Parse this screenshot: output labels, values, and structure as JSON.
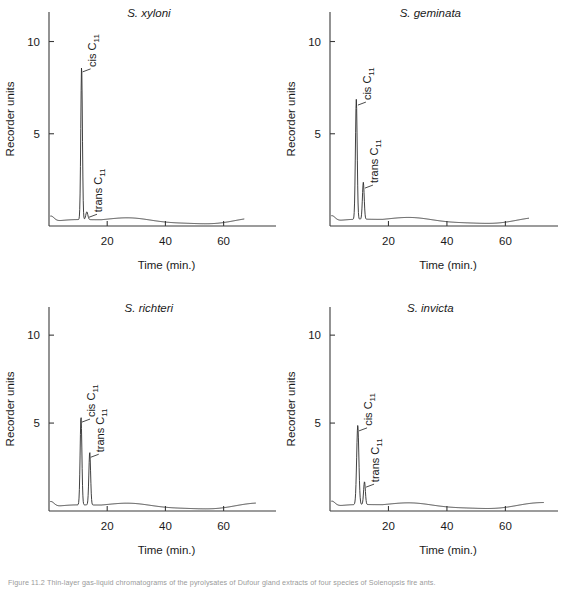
{
  "figure": {
    "caption": "Figure 11.2  Thin-layer gas-liquid chromatograms of the pyrolysates of Dufour gland extracts of four species of Solenopsis fire ants.",
    "background_color": "#ffffff",
    "trace_color": "#2b2b2b",
    "axis_color": "#3a3a3a"
  },
  "chart_data": [
    {
      "type": "line",
      "title": "S. xyloni",
      "xlabel": "Time (min.)",
      "ylabel": "Recorder units",
      "xlim": [
        0,
        78
      ],
      "ylim": [
        0,
        11.6
      ],
      "xticks": [
        20,
        40,
        60
      ],
      "yticks": [
        5,
        10
      ],
      "grid": false,
      "legend": "none",
      "axis_extent": {
        "x_axis_end": 78,
        "trace_end": 67
      },
      "annotations": [
        {
          "label": "cis C11",
          "label_text": "cis C",
          "subscript": "11",
          "x": 11.2,
          "y": 8.3
        },
        {
          "label": "trans C11",
          "label_text": "trans C",
          "subscript": "11",
          "x": 13.4,
          "y": 0.42
        }
      ],
      "peaks": [
        {
          "name": "cis C11",
          "retention_time": 11.2,
          "height": 8.3,
          "width": 0.55
        },
        {
          "name": "trans C11",
          "retention_time": 13.0,
          "height": 0.42,
          "width": 0.7
        }
      ],
      "baseline": 0.28
    },
    {
      "type": "line",
      "title": "S. geminata",
      "xlabel": "Time (min.)",
      "ylabel": "Recorder units",
      "xlim": [
        0,
        78
      ],
      "ylim": [
        0,
        11.6
      ],
      "xticks": [
        20,
        40,
        60
      ],
      "yticks": [
        5,
        10
      ],
      "grid": false,
      "legend": "none",
      "axis_extent": {
        "x_axis_end": 78,
        "trace_end": 68
      },
      "annotations": [
        {
          "label": "cis C11",
          "label_text": "cis C",
          "subscript": "11",
          "x": 9.2,
          "y": 6.5
        },
        {
          "label": "trans C11",
          "label_text": "trans C",
          "subscript": "11",
          "x": 11.6,
          "y": 2.0
        }
      ],
      "peaks": [
        {
          "name": "cis C11",
          "retention_time": 9.0,
          "height": 6.5,
          "width": 0.6
        },
        {
          "name": "trans C11",
          "retention_time": 11.4,
          "height": 2.0,
          "width": 0.6
        }
      ],
      "baseline": 0.3
    },
    {
      "type": "line",
      "title": "S. richteri",
      "xlabel": "Time (min.)",
      "ylabel": "Recorder units",
      "xlim": [
        0,
        78
      ],
      "ylim": [
        0,
        11.6
      ],
      "xticks": [
        20,
        40,
        60
      ],
      "yticks": [
        5,
        10
      ],
      "grid": false,
      "legend": "none",
      "axis_extent": {
        "x_axis_end": 78,
        "trace_end": 71
      },
      "annotations": [
        {
          "label": "cis C11",
          "label_text": "cis C",
          "subscript": "11",
          "x": 11.0,
          "y": 5.0
        },
        {
          "label": "trans C11",
          "label_text": "trans C",
          "subscript": "11",
          "x": 14.0,
          "y": 3.0
        }
      ],
      "peaks": [
        {
          "name": "cis C11",
          "retention_time": 11.0,
          "height": 5.0,
          "width": 0.6
        },
        {
          "name": "trans C11",
          "retention_time": 14.0,
          "height": 3.0,
          "width": 0.6
        }
      ],
      "baseline": 0.28
    },
    {
      "type": "line",
      "title": "S. invicta",
      "xlabel": "Time (min.)",
      "ylabel": "Recorder units",
      "xlim": [
        0,
        78
      ],
      "ylim": [
        0,
        11.6
      ],
      "xticks": [
        20,
        40,
        60
      ],
      "yticks": [
        5,
        10
      ],
      "grid": false,
      "legend": "none",
      "axis_extent": {
        "x_axis_end": 78,
        "trace_end": 73
      },
      "annotations": [
        {
          "label": "cis C11",
          "label_text": "cis C",
          "subscript": "11",
          "x": 9.6,
          "y": 4.5
        },
        {
          "label": "trans C11",
          "label_text": "trans C",
          "subscript": "11",
          "x": 12.0,
          "y": 1.3
        }
      ],
      "peaks": [
        {
          "name": "cis C11",
          "retention_time": 9.5,
          "height": 4.5,
          "width": 0.75
        },
        {
          "name": "trans C11",
          "retention_time": 11.8,
          "height": 1.3,
          "width": 0.6
        }
      ],
      "baseline": 0.3
    }
  ]
}
